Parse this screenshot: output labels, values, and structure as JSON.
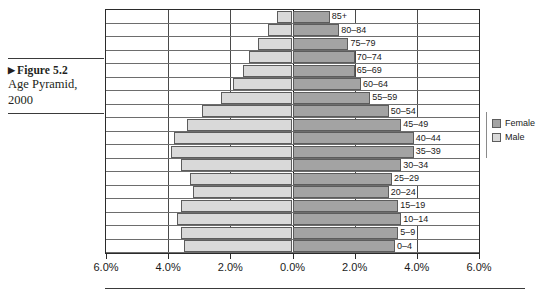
{
  "caption": {
    "marker": "▶",
    "figure_number": "Figure 5.2",
    "title": "Age Pyramid,",
    "year": "2000"
  },
  "legend": {
    "position": "right",
    "items": [
      {
        "label": "Female",
        "color": "#a3a3a3"
      },
      {
        "label": "Male",
        "color": "#d9d9d9"
      }
    ]
  },
  "axis": {
    "ticks": [
      "6.0%",
      "4.0%",
      "2.0%",
      "0.0%",
      "2.0%",
      "4.0%",
      "6.0%"
    ],
    "tick_values": [
      -6,
      -4,
      -2,
      0,
      2,
      4,
      6
    ]
  },
  "chart_data": {
    "type": "bar",
    "subtype": "population-pyramid",
    "title": "Age Pyramid, 2000",
    "xlabel": "",
    "ylabel": "",
    "xlim": [
      -6,
      6
    ],
    "grid": true,
    "legend_position": "right",
    "categories": [
      "85+",
      "80–84",
      "75–79",
      "70–74",
      "65–69",
      "60–64",
      "55–59",
      "50–54",
      "45–49",
      "40–44",
      "35–39",
      "30–34",
      "25–29",
      "20–24",
      "15–19",
      "10–14",
      "5–9",
      "0–4"
    ],
    "series": [
      {
        "name": "Male",
        "color": "#d9d9d9",
        "values": [
          0.5,
          0.8,
          1.1,
          1.4,
          1.6,
          1.9,
          2.3,
          2.9,
          3.4,
          3.8,
          3.9,
          3.6,
          3.3,
          3.2,
          3.6,
          3.7,
          3.6,
          3.5
        ]
      },
      {
        "name": "Female",
        "color": "#a3a3a3",
        "values": [
          1.2,
          1.5,
          1.8,
          2.0,
          2.0,
          2.2,
          2.5,
          3.1,
          3.5,
          3.9,
          3.9,
          3.5,
          3.2,
          3.1,
          3.4,
          3.5,
          3.4,
          3.3
        ]
      }
    ]
  }
}
